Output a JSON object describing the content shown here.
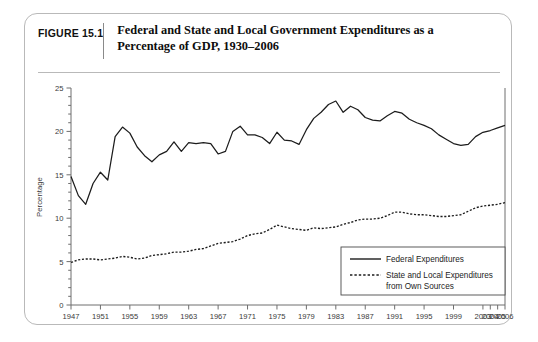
{
  "figure": {
    "label": "FIGURE 15.1",
    "title_line1": "Federal and State and Local Government Expenditures as a",
    "title_line2": "Percentage of GDP, 1930–2006"
  },
  "colors": {
    "card_border": "#b9b9b9",
    "axis": "#6e6e6e",
    "federal_line": "#1c1c1c",
    "state_local_line": "#1c1c1c",
    "text": "#1c1c1c"
  },
  "chart_data": {
    "type": "line",
    "title": "Federal and State and Local Government Expenditures as a Percentage of GDP, 1930–2006",
    "xlabel": "",
    "ylabel": "Percentage",
    "ylim": [
      0,
      25
    ],
    "yticks": [
      0,
      5,
      10,
      15,
      20,
      25
    ],
    "y_minor_tick_step": 1,
    "grid": false,
    "legend_position": "bottom-right",
    "xlim": [
      1947,
      2006
    ],
    "xtick_labels": [
      "1947",
      "1951",
      "1955",
      "1959",
      "1963",
      "1967",
      "1971",
      "1975",
      "1979",
      "1983",
      "1987",
      "1991",
      "1995",
      "1999",
      "2003",
      "2004",
      "2005",
      "2006"
    ],
    "x": [
      1947,
      1948,
      1949,
      1950,
      1951,
      1952,
      1953,
      1954,
      1955,
      1956,
      1957,
      1958,
      1959,
      1960,
      1961,
      1962,
      1963,
      1964,
      1965,
      1966,
      1967,
      1968,
      1969,
      1970,
      1971,
      1972,
      1973,
      1974,
      1975,
      1976,
      1977,
      1978,
      1979,
      1980,
      1981,
      1982,
      1983,
      1984,
      1985,
      1986,
      1987,
      1988,
      1989,
      1990,
      1991,
      1992,
      1993,
      1994,
      1995,
      1996,
      1997,
      1998,
      1999,
      2000,
      2001,
      2002,
      2003,
      2004,
      2005,
      2006
    ],
    "series": [
      {
        "name": "Federal Expenditures",
        "style": "solid",
        "values": [
          14.8,
          12.6,
          11.6,
          14.0,
          15.3,
          14.4,
          19.4,
          20.5,
          19.8,
          18.2,
          17.2,
          16.5,
          17.3,
          17.7,
          18.8,
          17.7,
          18.7,
          18.6,
          18.7,
          18.6,
          17.4,
          17.7,
          20.0,
          20.6,
          19.6,
          19.6,
          19.3,
          18.6,
          19.9,
          19.0,
          18.9,
          18.5,
          20.2,
          21.5,
          22.2,
          23.1,
          23.5,
          22.2,
          22.9,
          22.5,
          21.6,
          21.3,
          21.2,
          21.8,
          22.3,
          22.1,
          21.4,
          21.0,
          20.7,
          20.3,
          19.6,
          19.1,
          18.6,
          18.4,
          18.5,
          19.4,
          19.9,
          20.1,
          20.4,
          20.7
        ]
      },
      {
        "name": "State and Local Expenditures from Own Sources",
        "style": "dotted",
        "values": [
          4.9,
          5.2,
          5.3,
          5.3,
          5.2,
          5.3,
          5.4,
          5.6,
          5.5,
          5.3,
          5.4,
          5.7,
          5.8,
          5.9,
          6.1,
          6.1,
          6.2,
          6.4,
          6.5,
          6.8,
          7.1,
          7.2,
          7.3,
          7.6,
          8.0,
          8.2,
          8.3,
          8.7,
          9.2,
          9.0,
          8.8,
          8.7,
          8.6,
          8.9,
          8.8,
          8.9,
          9.0,
          9.3,
          9.5,
          9.8,
          9.9,
          9.9,
          10.0,
          10.3,
          10.7,
          10.7,
          10.5,
          10.4,
          10.4,
          10.3,
          10.2,
          10.2,
          10.3,
          10.4,
          10.8,
          11.2,
          11.4,
          11.5,
          11.6,
          11.8
        ]
      }
    ]
  },
  "legend": {
    "items": [
      {
        "label": "Federal Expenditures",
        "style": "solid"
      },
      {
        "label": "State and Local Expenditures",
        "label_line2": "from Own Sources",
        "style": "dotted"
      }
    ]
  }
}
